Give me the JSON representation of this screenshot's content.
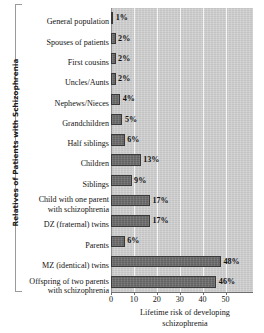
{
  "chart_data": {
    "type": "bar",
    "orientation": "horizontal",
    "title": "",
    "xlabel": "Lifetime risk of developing\nschizophrenia",
    "ylabel": "Relatives of Patients with Schizophrenia",
    "xlim": [
      0,
      62
    ],
    "xticks": [
      0,
      10,
      20,
      30,
      40,
      50
    ],
    "xticklabels": [
      "0",
      "10",
      "20",
      "30",
      "40",
      "50"
    ],
    "grid": "vertical-white-gridlines",
    "legend": "none",
    "categories": [
      "General population",
      "Spouses of patients",
      "First cousins",
      "Uncles/Aunts",
      "Nephews/Nieces",
      "Grandchildren",
      "Half siblings",
      "Children",
      "Siblings",
      "Child with one parent\nwith schizophrenia",
      "DZ (fraternal) twins",
      "Parents",
      "MZ (identical) twins",
      "Offspring of two parents\nwith schizophrenia"
    ],
    "values": [
      1,
      2,
      2,
      2,
      4,
      5,
      6,
      13,
      9,
      17,
      17,
      6,
      48,
      46
    ],
    "value_labels": [
      "1%",
      "2%",
      "2%",
      "2%",
      "4%",
      "5%",
      "6%",
      "13%",
      "9%",
      "17%",
      "17%",
      "6%",
      "48%",
      "46%"
    ],
    "colors": {
      "bar_fill": "#6b6b6b",
      "bar_edge": "#3a3a3a",
      "plot_background": "#c9c9c9",
      "gridline": "#f4f4f4",
      "axis": "#6f6f6f",
      "text": "#141414"
    }
  }
}
